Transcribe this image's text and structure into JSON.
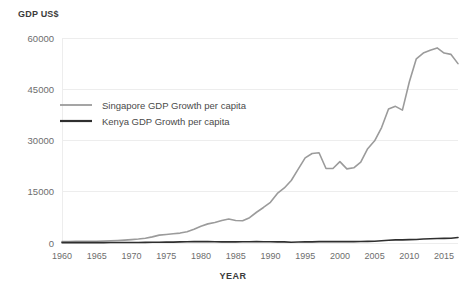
{
  "chart_data": {
    "type": "line",
    "title": "",
    "xlabel": "YEAR",
    "ylabel": "GDP US$",
    "xlim": [
      1960,
      2017
    ],
    "ylim": [
      0,
      60000
    ],
    "grid": true,
    "legend_position": "upper-left-inside",
    "xticks": [
      "1960",
      "1965",
      "1970",
      "1975",
      "1980",
      "1985",
      "1990",
      "1995",
      "2000",
      "2005",
      "2010",
      "2015"
    ],
    "xtick_values": [
      1960,
      1965,
      1970,
      1975,
      1980,
      1985,
      1990,
      1995,
      2000,
      2005,
      2010,
      2015
    ],
    "yticks": [
      "0",
      "15000",
      "30000",
      "45000",
      "60000"
    ],
    "ytick_values": [
      0,
      15000,
      30000,
      45000,
      60000
    ],
    "x": [
      1960,
      1961,
      1962,
      1963,
      1964,
      1965,
      1966,
      1967,
      1968,
      1969,
      1970,
      1971,
      1972,
      1973,
      1974,
      1975,
      1976,
      1977,
      1978,
      1979,
      1980,
      1981,
      1982,
      1983,
      1984,
      1985,
      1986,
      1987,
      1988,
      1989,
      1990,
      1991,
      1992,
      1993,
      1994,
      1995,
      1996,
      1997,
      1998,
      1999,
      2000,
      2001,
      2002,
      2003,
      2004,
      2005,
      2006,
      2007,
      2008,
      2009,
      2010,
      2011,
      2012,
      2013,
      2014,
      2015,
      2016,
      2017
    ],
    "series": [
      {
        "name": "Singapore GDP Growth per capita",
        "color": "#9b9b9b",
        "width": 1.6,
        "values": [
          430,
          450,
          470,
          510,
          490,
          520,
          570,
          640,
          730,
          850,
          980,
          1150,
          1380,
          1800,
          2300,
          2500,
          2700,
          2900,
          3300,
          4000,
          4900,
          5600,
          6000,
          6600,
          7000,
          6600,
          6500,
          7400,
          9000,
          10400,
          11900,
          14500,
          16100,
          18300,
          21600,
          24900,
          26200,
          26400,
          21800,
          21800,
          23800,
          21700,
          22000,
          23700,
          27600,
          29900,
          33800,
          39200,
          40000,
          38900,
          47200,
          53900,
          55600,
          56400,
          57100,
          55600,
          55200,
          52500
        ]
      },
      {
        "name": "Kenya GDP Growth per capita",
        "color": "#2f2f2f",
        "width": 1.6,
        "values": [
          98,
          97,
          100,
          106,
          106,
          105,
          123,
          127,
          133,
          140,
          155,
          166,
          186,
          206,
          230,
          247,
          261,
          324,
          352,
          391,
          446,
          407,
          372,
          342,
          339,
          331,
          360,
          383,
          390,
          376,
          366,
          340,
          331,
          222,
          280,
          341,
          333,
          398,
          411,
          405,
          404,
          412,
          412,
          450,
          474,
          533,
          679,
          801,
          907,
          910,
          977,
          1004,
          1186,
          1246,
          1335,
          1355,
          1410,
          1595
        ]
      }
    ]
  },
  "legend": {
    "items": [
      {
        "label": "Singapore GDP Growth per capita",
        "color": "#9b9b9b"
      },
      {
        "label": "Kenya GDP Growth per capita",
        "color": "#2f2f2f"
      }
    ]
  },
  "axis": {
    "y_title": "GDP US$",
    "x_title": "YEAR"
  }
}
